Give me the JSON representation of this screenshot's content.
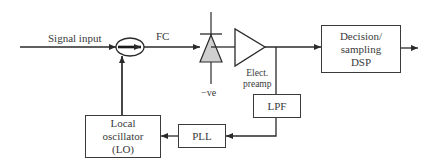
{
  "diagram": {
    "labels": {
      "signal_input": "Signal input",
      "fc": "FC",
      "neg_bias": "−ve",
      "preamp_line1": "Elect.",
      "preamp_line2": "preamp"
    },
    "blocks": {
      "dsp": {
        "line1": "Decision/",
        "line2": "sampling",
        "line3": "DSP"
      },
      "lpf": {
        "label": "LPF"
      },
      "pll": {
        "label": "PLL"
      },
      "lo": {
        "line1": "Local",
        "line2": "oscillator",
        "line3": "(LO)"
      }
    },
    "components": [
      "fiber-coupler-icon",
      "photodiode-icon",
      "amplifier-icon"
    ],
    "colors": {
      "line": "#2a2a2a",
      "photodiode_fill": "#cfcfcf",
      "box_border": "#3a3a3a"
    }
  }
}
